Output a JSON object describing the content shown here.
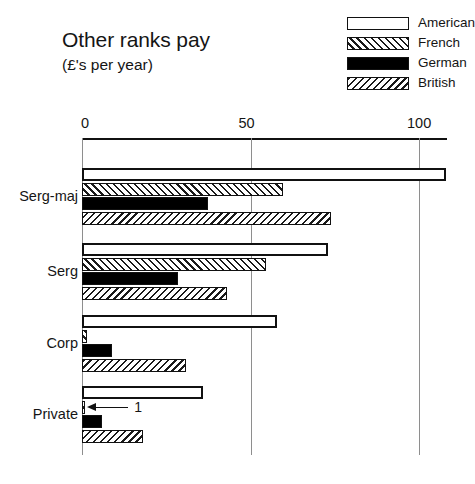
{
  "chart_data": {
    "type": "bar",
    "orientation": "horizontal",
    "title": "Other ranks pay",
    "subtitle": "(£'s per year)",
    "xlabel": "",
    "ylabel": "",
    "xlim": [
      0,
      110
    ],
    "xticks": [
      0,
      50,
      100
    ],
    "xtick_labels": [
      "0",
      "50",
      "100"
    ],
    "grid": true,
    "legend_position": "top-right",
    "categories": [
      "Serg-maj",
      "Serg",
      "Corp",
      "Private"
    ],
    "series": [
      {
        "name": "American",
        "fill": "empty",
        "values": [
          108,
          73,
          58,
          36
        ]
      },
      {
        "name": "French",
        "fill": "forward-hatch",
        "values": [
          59.5,
          54.5,
          1.5,
          1
        ]
      },
      {
        "name": "German",
        "fill": "solid-black",
        "values": [
          37.5,
          28.5,
          9,
          6
        ]
      },
      {
        "name": "British",
        "fill": "backward-hatch",
        "values": [
          74,
          43,
          31,
          18
        ]
      }
    ],
    "annotations": [
      {
        "text": "1",
        "points_to_series": "French",
        "points_to_category": "Private"
      }
    ]
  },
  "legend": {
    "items": [
      {
        "label": "American",
        "swatch": "empty"
      },
      {
        "label": "French",
        "swatch": "forward-hatch"
      },
      {
        "label": "German",
        "swatch": "solid-black"
      },
      {
        "label": "British",
        "swatch": "backward-hatch"
      }
    ]
  },
  "colors": {
    "bar_outline": "#111111",
    "solid_fill": "#000000",
    "gridline": "#8e8e8e",
    "background": "#ffffff",
    "text": "#151515"
  }
}
